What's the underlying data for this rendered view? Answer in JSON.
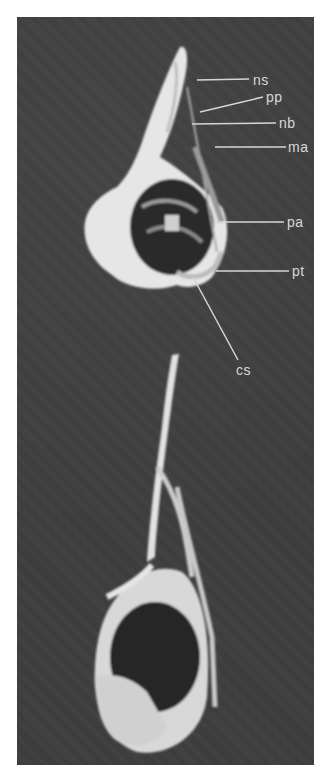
{
  "figure": {
    "background_color": "#3f3f3f",
    "bone_color": "#e8e8e8",
    "label_color": "#d8d8d8",
    "labels": [
      {
        "id": "ns",
        "text": "ns"
      },
      {
        "id": "pp",
        "text": "pp"
      },
      {
        "id": "nb",
        "text": "nb"
      },
      {
        "id": "ma",
        "text": "ma"
      },
      {
        "id": "pa",
        "text": "pa"
      },
      {
        "id": "pt",
        "text": "pt"
      },
      {
        "id": "cs",
        "text": "cs"
      }
    ]
  }
}
